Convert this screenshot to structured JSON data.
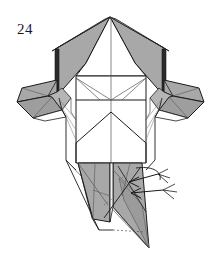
{
  "figure": {
    "step_number": "24",
    "background_color": "#ffffff",
    "line_color": "#1a1a1a",
    "shade_color": "#a8a8a8",
    "shade_color_dark": "#8f8f8f",
    "shade_color_light": "#bdbdbd",
    "crease_color": "#555555",
    "arrow_color": "#1a1a1a"
  },
  "canvas": {
    "width": 222,
    "height": 273
  },
  "annotations": {
    "arrow_count": 2,
    "arrow_direction": "left",
    "arrow_label": "fold-in arrows"
  },
  "shapes": {
    "top_left_flap": "M110,17 L58,47 L55,49 L58,95 L78,78 L86,62 Z",
    "top_right_flap": "M110,17 L163,47 L166,49 L163,95 L143,78 L135,62 Z",
    "left_wing": "M58,78 L22,88 L16,104 L33,118 L62,108 L70,96 Z",
    "right_wing": "M163,78 L199,88 L205,104 L188,118 L159,108 L151,96 Z",
    "bottom_left_shade": "M78,163 L110,163 L110,230 L92,218 Z",
    "bottom_right_shade": "M113,163 L142,163 L145,248 L113,205 Z",
    "center_panel": "M76,76 L146,76 L146,163 L76,163 Z"
  },
  "labels": {
    "figure_caption": "24"
  }
}
